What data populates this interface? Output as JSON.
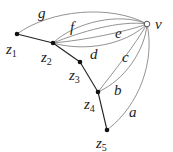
{
  "diagram": {
    "nodes": [
      {
        "id": "z1",
        "label": "z",
        "sub": "1",
        "x": 17,
        "y": 34,
        "filled": true
      },
      {
        "id": "z2",
        "label": "z",
        "sub": "2",
        "x": 53,
        "y": 43,
        "filled": true
      },
      {
        "id": "z3",
        "label": "z",
        "sub": "3",
        "x": 80,
        "y": 62,
        "filled": true
      },
      {
        "id": "z4",
        "label": "z",
        "sub": "4",
        "x": 98,
        "y": 92,
        "filled": true
      },
      {
        "id": "z5",
        "label": "z",
        "sub": "5",
        "x": 107,
        "y": 130,
        "filled": true
      },
      {
        "id": "v",
        "label": "v",
        "x": 147,
        "y": 24,
        "filled": false
      }
    ],
    "tree_edges": [
      [
        "z1",
        "z2"
      ],
      [
        "z2",
        "z3"
      ],
      [
        "z3",
        "z4"
      ],
      [
        "z4",
        "z5"
      ]
    ],
    "curve_edges": [
      {
        "label": "g",
        "from": "z1",
        "to": "v"
      },
      {
        "label": "f",
        "from": "z2",
        "to": "v"
      },
      {
        "label": "",
        "from": "z2",
        "to": "v"
      },
      {
        "label": "e",
        "from": "z2",
        "to": "v"
      },
      {
        "label": "d",
        "from": "z2",
        "to": "v"
      },
      {
        "label": "c",
        "from": "z4",
        "to": "v"
      },
      {
        "label": "b",
        "from": "z4",
        "to": "v"
      },
      {
        "label": "a",
        "from": "z5",
        "to": "v"
      }
    ],
    "edge_labels": {
      "a": "a",
      "b": "b",
      "c": "c",
      "d": "d",
      "e": "e",
      "f": "f",
      "g": "g"
    },
    "node_labels": {
      "z": "z",
      "v": "v",
      "s1": "1",
      "s2": "2",
      "s3": "3",
      "s4": "4",
      "s5": "5"
    }
  }
}
